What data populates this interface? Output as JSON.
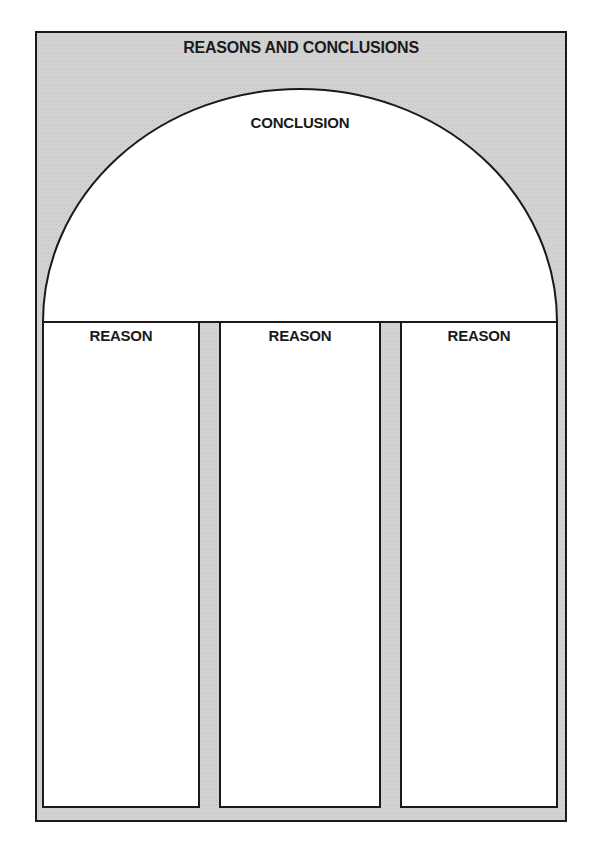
{
  "organizer": {
    "title": "REASONS AND CONCLUSIONS",
    "conclusion": {
      "label": "CONCLUSION"
    },
    "reasons": [
      {
        "label": "REASON"
      },
      {
        "label": "REASON"
      },
      {
        "label": "REASON"
      }
    ]
  },
  "colors": {
    "frame_fill": "#d2d2d2",
    "panel_fill": "#ffffff",
    "stroke": "#1a1a1a"
  }
}
